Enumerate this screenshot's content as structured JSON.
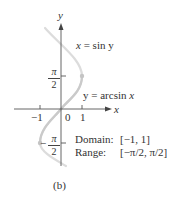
{
  "figure": {
    "caption": "(b)",
    "axes": {
      "x_label": "x",
      "y_label": "y",
      "origin_label": "0",
      "x_ticks": [
        {
          "value": -1,
          "label": "−1"
        },
        {
          "value": 1,
          "label": "1"
        }
      ],
      "y_ticks": [
        {
          "value": "π/2",
          "numerator": "π",
          "denominator": "2",
          "sign": ""
        },
        {
          "value": "−π/2",
          "numerator": "π",
          "denominator": "2",
          "sign": "−"
        }
      ]
    },
    "curves": {
      "sin_label": "x = sin y",
      "sin_label_var": "x",
      "sin_label_rest": " = sin y",
      "arcsin_label": "y = arcsin x",
      "arcsin_label_prefix": "y = arcsin ",
      "arcsin_label_var": "x"
    },
    "info": {
      "domain_label": "Domain:",
      "domain_value": "[−1, 1]",
      "range_label": "Range:",
      "range_value": "[−π/2, π/2]"
    },
    "colors": {
      "axis": "#555555",
      "sin_curve": "#d8d8d8",
      "arcsin_curve": "#c8c8c8",
      "text": "#333333"
    }
  }
}
